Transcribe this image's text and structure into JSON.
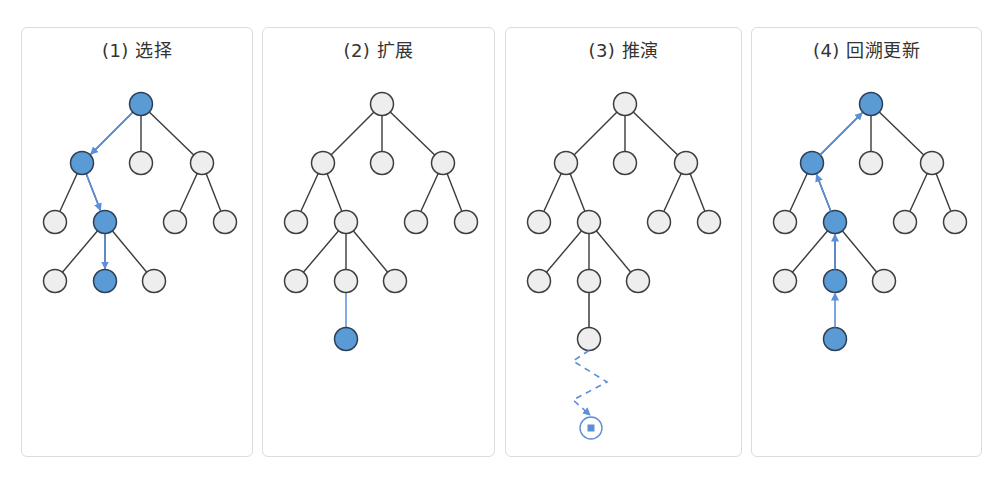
{
  "colors": {
    "edge": "#3a3a3a",
    "node_outline": "#3d3d3d",
    "node_fill": "#eeeeef",
    "node_active_fill": "#5b9bd5",
    "node_active_outline": "#2b3f55",
    "arrow": "#5b8fd8",
    "panel_border": "#dcdcdc"
  },
  "layout": {
    "node_radius": 11.5,
    "levels_y": [
      76,
      135,
      194,
      253,
      311
    ],
    "nodes": {
      "root": {
        "x": 119,
        "level": 0
      },
      "a": {
        "x": 60,
        "level": 1
      },
      "b": {
        "x": 119,
        "level": 1
      },
      "c": {
        "x": 180,
        "level": 1
      },
      "aa": {
        "x": 33,
        "level": 2
      },
      "ab": {
        "x": 83,
        "level": 2
      },
      "ca": {
        "x": 153,
        "level": 2
      },
      "cb": {
        "x": 203,
        "level": 2
      },
      "aba": {
        "x": 33,
        "level": 3
      },
      "abb": {
        "x": 83,
        "level": 3
      },
      "abc": {
        "x": 132,
        "level": 3
      },
      "abbn": {
        "x": 83,
        "level": 4
      }
    },
    "edges": [
      [
        "root",
        "a"
      ],
      [
        "root",
        "b"
      ],
      [
        "root",
        "c"
      ],
      [
        "a",
        "aa"
      ],
      [
        "a",
        "ab"
      ],
      [
        "c",
        "ca"
      ],
      [
        "c",
        "cb"
      ],
      [
        "ab",
        "aba"
      ],
      [
        "ab",
        "abb"
      ],
      [
        "ab",
        "abc"
      ]
    ]
  },
  "panels": [
    {
      "id": "select",
      "title": "(1) 选择",
      "left": 21,
      "width": 232,
      "active_nodes": [
        "root",
        "a",
        "ab",
        "abb"
      ],
      "arrows_down": [
        [
          "root",
          "a"
        ],
        [
          "a",
          "ab"
        ],
        [
          "ab",
          "abb"
        ]
      ],
      "arrows_up": [],
      "new_edge": null,
      "show_expanded_node": false,
      "rollout": false
    },
    {
      "id": "expand",
      "title": "(2) 扩展",
      "left": 262,
      "width": 233,
      "active_nodes": [
        "abbn"
      ],
      "arrows_down": [],
      "arrows_up": [],
      "new_edge": [
        "abb",
        "abbn"
      ],
      "new_edge_color": "blue",
      "show_expanded_node": true,
      "rollout": false
    },
    {
      "id": "rollout",
      "title": "(3) 推演",
      "left": 505,
      "width": 237,
      "active_nodes": [],
      "arrows_down": [],
      "arrows_up": [],
      "new_edge": [
        "abb",
        "abbn"
      ],
      "new_edge_color": "dark",
      "show_expanded_node": true,
      "rollout": true,
      "rollout_terminal": {
        "x": 85,
        "y": 400,
        "r": 11,
        "square": 7
      }
    },
    {
      "id": "backprop",
      "title": "(4) 回溯更新",
      "left": 751,
      "width": 231,
      "active_nodes": [
        "root",
        "a",
        "ab",
        "abb",
        "abbn"
      ],
      "arrows_down": [],
      "arrows_up": [
        [
          "abbn",
          "abb"
        ],
        [
          "abb",
          "ab"
        ],
        [
          "ab",
          "a"
        ],
        [
          "a",
          "root"
        ]
      ],
      "new_edge": [
        "abb",
        "abbn"
      ],
      "new_edge_color": "none",
      "show_expanded_node": true,
      "rollout": false
    }
  ]
}
